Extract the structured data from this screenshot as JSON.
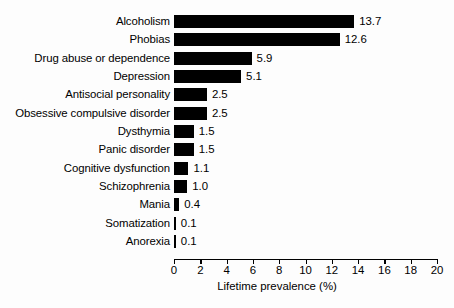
{
  "chart_data": {
    "type": "bar",
    "orientation": "horizontal",
    "title": "",
    "subtitle": "",
    "xlabel": "Lifetime prevalence (%)",
    "ylabel": "",
    "xlim": [
      0,
      20
    ],
    "xticks": [
      0,
      2,
      4,
      6,
      8,
      10,
      12,
      14,
      16,
      18,
      20
    ],
    "xtick_labels": [
      "0",
      "2",
      "4",
      "6",
      "8",
      "10",
      "12",
      "14",
      "16",
      "18",
      "20"
    ],
    "grid": false,
    "legend": null,
    "bar_color": "#000000",
    "background_color": "#fdfdfd",
    "categories": [
      "Alcoholism",
      "Phobias",
      "Drug abuse or dependence",
      "Depression",
      "Antisocial personality",
      "Obsessive compulsive disorder",
      "Dysthymia",
      "Panic disorder",
      "Cognitive dysfunction",
      "Schizophrenia",
      "Mania",
      "Somatization",
      "Anorexia"
    ],
    "values": [
      13.7,
      12.6,
      5.9,
      5.1,
      2.5,
      2.5,
      1.5,
      1.5,
      1.1,
      1.0,
      0.4,
      0.1,
      0.1
    ],
    "value_labels": [
      "13.7",
      "12.6",
      "5.9",
      "5.1",
      "2.5",
      "2.5",
      "1.5",
      "1.5",
      "1.1",
      "1.0",
      "0.4",
      "0.1",
      "0.1"
    ]
  }
}
